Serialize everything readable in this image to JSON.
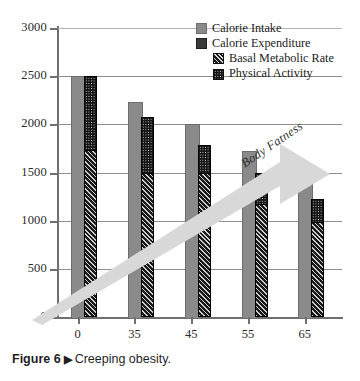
{
  "caption": {
    "figure_number": "Figure 6",
    "marker": "▶",
    "text": "Creeping obesity."
  },
  "legend": {
    "items": [
      {
        "label": "Calorie Intake",
        "swatch": "solid-gray-swatch",
        "indent": false
      },
      {
        "label": "Calorie Expenditure",
        "swatch": "solid-dark-swatch",
        "indent": false
      },
      {
        "label": "Basal Metabolic Rate",
        "swatch": "diagonal-hatch-swatch",
        "indent": true
      },
      {
        "label": "Physical Activity",
        "swatch": "dotted-fill-swatch",
        "indent": true
      }
    ]
  },
  "annotation": {
    "arrow_label": "Body Fatness",
    "arrow_direction": "up-right",
    "arrow_color": "#d6d6d6"
  },
  "chart_data": {
    "type": "bar",
    "title": "",
    "subtitle": "",
    "xlabel": "",
    "ylabel": "",
    "categories": [
      "0",
      "35",
      "45",
      "55",
      "65"
    ],
    "ylim": [
      0,
      3000
    ],
    "yticks": [
      0,
      500,
      1000,
      1500,
      2000,
      2500,
      3000
    ],
    "ytick_labels": [
      "0",
      "500",
      "1000",
      "1500",
      "2000",
      "2500",
      "3000"
    ],
    "grid": true,
    "legend_position": "top-right",
    "series": [
      {
        "name": "Calorie Intake",
        "fill": "solid-gray",
        "color": "#8a8a8a",
        "values": [
          2500,
          2230,
          2000,
          1720,
          1500
        ]
      },
      {
        "name": "Calorie Expenditure",
        "fill": "stacked-dark",
        "color": "#1c1c1c",
        "values": [
          2500,
          2080,
          1790,
          1490,
          1220
        ],
        "stack": [
          {
            "name": "Basal Metabolic Rate",
            "fill": "diagonal-hatch",
            "color": "#1a1a1a",
            "values": [
              1740,
              1500,
              1500,
              1180,
              1000
            ]
          },
          {
            "name": "Physical Activity",
            "fill": "dotted",
            "color": "#151515",
            "values": [
              760,
              580,
              290,
              310,
              220
            ]
          }
        ]
      }
    ]
  }
}
